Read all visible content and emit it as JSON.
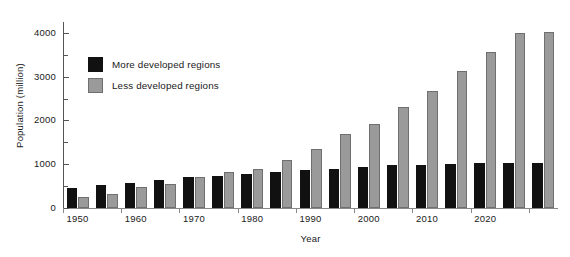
{
  "chart_data": {
    "type": "bar",
    "title": "",
    "xlabel": "Year",
    "ylabel": "Population (million)",
    "ylim": [
      0,
      4250
    ],
    "ytick_labels": [
      "0",
      "1000",
      "2000",
      "3000",
      "4000"
    ],
    "ytick_values": [
      0,
      1000,
      2000,
      3000,
      4000
    ],
    "yminor_values": [
      500,
      1500,
      2500,
      3500
    ],
    "grid": false,
    "legend_position": "upper-left-inside",
    "categories": [
      "1950",
      "1955",
      "1960",
      "1965",
      "1970",
      "1975",
      "1980",
      "1985",
      "1990",
      "1995",
      "2000",
      "2005",
      "2010",
      "2015",
      "2020",
      "2025",
      "2030"
    ],
    "xtick_labels": [
      "1950",
      "1960",
      "1970",
      "1980",
      "1990",
      "2000",
      "2010",
      "2020"
    ],
    "xtick_categories": [
      "1950",
      "1960",
      "1970",
      "1980",
      "1990",
      "2000",
      "2010",
      "2020"
    ],
    "series": [
      {
        "name": "More developed regions",
        "color": "#111111",
        "values": [
          450,
          530,
          580,
          640,
          700,
          740,
          780,
          820,
          860,
          900,
          940,
          980,
          990,
          1000,
          1020,
          1030,
          1030
        ]
      },
      {
        "name": "Less developed regions",
        "color": "#9a9a9a",
        "values": [
          260,
          320,
          480,
          540,
          700,
          830,
          890,
          1100,
          1340,
          1680,
          1930,
          2310,
          2680,
          3140,
          3570,
          4000,
          4020
        ]
      }
    ]
  },
  "legend": {
    "items": [
      {
        "label": "More developed regions",
        "icon": "black-square-swatch"
      },
      {
        "label": "Less developed regions",
        "icon": "gray-square-swatch"
      }
    ]
  },
  "axes": {
    "x_title": "Year",
    "y_title": "Population (million)"
  }
}
